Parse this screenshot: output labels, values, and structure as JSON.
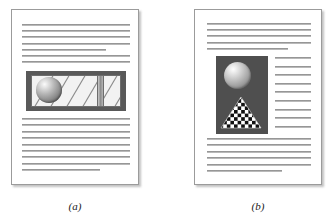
{
  "figure": {
    "background_color": "#ffffff",
    "panels": [
      {
        "id": "a",
        "caption": "(a)",
        "page": {
          "border_color": "#9b9b9b",
          "paper_color": "#ffffff",
          "shadow": true
        },
        "illustration": {
          "name": "banner-graphic-sphere-and-diagonals",
          "frame_color": "#595959",
          "interior_color": "#f2f2f2",
          "diagonal_stripe_color": "#7d7d7d",
          "vertical_bar_color": "#9a9a9a",
          "sphere": {
            "highlight_color": "#f4f4f4",
            "mid_color": "#9a9a9a",
            "shadow_color": "#4a4a4a"
          },
          "position": "full-width-centered",
          "text_wrap": "none"
        },
        "text_blocks": [
          {
            "name": "top-paragraph",
            "lines": [
              {
                "width": 100,
                "tone": "dark"
              },
              {
                "width": 100,
                "tone": "dark"
              },
              {
                "width": 100,
                "tone": "dark"
              },
              {
                "width": 100,
                "tone": "dark"
              },
              {
                "width": 78,
                "tone": "dark"
              },
              {
                "width": 100,
                "tone": "dark"
              },
              {
                "width": 100,
                "tone": "dark"
              }
            ]
          },
          {
            "name": "bottom-paragraph",
            "lines": [
              {
                "width": 100,
                "tone": "dark"
              },
              {
                "width": 100,
                "tone": "dark"
              },
              {
                "width": 100,
                "tone": "dark"
              },
              {
                "width": 100,
                "tone": "dark"
              },
              {
                "width": 100,
                "tone": "dark"
              },
              {
                "width": 100,
                "tone": "dark"
              },
              {
                "width": 100,
                "tone": "dark"
              },
              {
                "width": 100,
                "tone": "dark"
              },
              {
                "width": 72,
                "tone": "dark"
              }
            ]
          }
        ]
      },
      {
        "id": "b",
        "caption": "(b)",
        "page": {
          "border_color": "#9b9b9b",
          "paper_color": "#ffffff",
          "shadow": true
        },
        "illustration": {
          "name": "photo-block-sphere-and-checker-triangle",
          "background_color": "#4f4f4f",
          "sphere": {
            "highlight_color": "#f4f4f4",
            "mid_color": "#a8a8a8",
            "shadow_color": "#5e5e5e"
          },
          "triangle": {
            "pattern": "checkerboard",
            "light_color": "#ffffff",
            "dark_color": "#111111"
          },
          "position": "left-inset",
          "text_wrap": "right-column"
        },
        "text_blocks": [
          {
            "name": "top-paragraph",
            "lines": [
              {
                "width": 100,
                "tone": "dark"
              },
              {
                "width": 100,
                "tone": "dark"
              },
              {
                "width": 100,
                "tone": "dark"
              },
              {
                "width": 100,
                "tone": "dark"
              },
              {
                "width": 78,
                "tone": "dark"
              }
            ]
          },
          {
            "name": "wrapped-right-column",
            "lines": [
              {
                "width": 100,
                "tone": "dark"
              },
              {
                "width": 100,
                "tone": "dark"
              },
              {
                "width": 100,
                "tone": "dark"
              },
              {
                "width": 100,
                "tone": "dark"
              },
              {
                "width": 100,
                "tone": "dark"
              },
              {
                "width": 100,
                "tone": "dark"
              },
              {
                "width": 100,
                "tone": "dark"
              },
              {
                "width": 100,
                "tone": "dark"
              },
              {
                "width": 100,
                "tone": "dark"
              }
            ]
          },
          {
            "name": "bottom-paragraph",
            "lines": [
              {
                "width": 100,
                "tone": "dark"
              },
              {
                "width": 100,
                "tone": "dark"
              },
              {
                "width": 100,
                "tone": "dark"
              },
              {
                "width": 100,
                "tone": "dark"
              },
              {
                "width": 100,
                "tone": "dark"
              },
              {
                "width": 72,
                "tone": "dark"
              }
            ]
          }
        ]
      }
    ]
  }
}
